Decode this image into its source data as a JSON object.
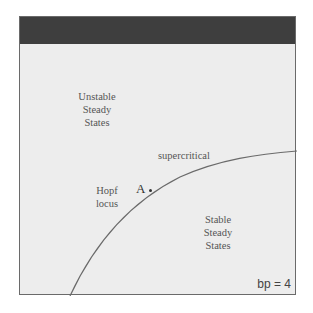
{
  "diagram": {
    "regions": {
      "unstable": [
        "Unstable",
        "Steady",
        "States"
      ],
      "stable": [
        "Stable",
        "Steady",
        "States"
      ]
    },
    "curve_label": "supercritical",
    "locus_label": [
      "Hopf",
      "locus"
    ],
    "point": {
      "label": "A"
    },
    "parameter": "bp = 4",
    "colors": {
      "header_bar": "#3e3e3e",
      "background": "#ededed",
      "curve": "#6a6a6a",
      "text": "#555555"
    }
  }
}
